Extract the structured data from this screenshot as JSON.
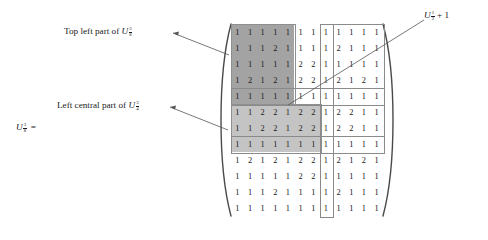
{
  "figure": {
    "lhs": {
      "variable": "U",
      "subscript_num": "3",
      "subscript_den": "8",
      "equals": "="
    },
    "annotations": [
      {
        "id": "top-left",
        "text_before": "Top left part of ",
        "variable": "U",
        "subscript_num": "3",
        "subscript_den": "8"
      },
      {
        "id": "left-central",
        "text_before": "Left central part of ",
        "variable": "U",
        "subscript_num": "3",
        "subscript_den": "4"
      },
      {
        "id": "u-half-plus-one",
        "text_before": "",
        "variable": "U",
        "subscript_num": "1",
        "subscript_den": "2",
        "text_after": " + 1"
      }
    ],
    "matrix": {
      "rows": 12,
      "cols": 12,
      "values": [
        [
          1,
          1,
          1,
          1,
          1,
          1,
          1,
          1,
          1,
          1,
          1,
          1
        ],
        [
          1,
          1,
          1,
          2,
          1,
          1,
          1,
          1,
          2,
          1,
          1,
          1
        ],
        [
          1,
          1,
          1,
          1,
          1,
          2,
          2,
          1,
          1,
          1,
          1,
          1
        ],
        [
          1,
          2,
          1,
          2,
          1,
          2,
          2,
          1,
          2,
          1,
          2,
          1
        ],
        [
          1,
          1,
          1,
          1,
          1,
          1,
          1,
          1,
          1,
          1,
          1,
          1
        ],
        [
          1,
          1,
          2,
          2,
          1,
          2,
          2,
          1,
          2,
          2,
          1,
          1
        ],
        [
          1,
          1,
          2,
          2,
          1,
          2,
          2,
          1,
          2,
          2,
          1,
          1
        ],
        [
          1,
          1,
          1,
          1,
          1,
          1,
          1,
          1,
          1,
          1,
          1,
          1
        ],
        [
          1,
          2,
          1,
          2,
          1,
          2,
          2,
          1,
          2,
          1,
          2,
          1
        ],
        [
          1,
          1,
          1,
          1,
          1,
          2,
          2,
          1,
          1,
          1,
          1,
          1
        ],
        [
          1,
          1,
          1,
          2,
          1,
          1,
          1,
          1,
          2,
          1,
          1,
          1
        ],
        [
          1,
          1,
          1,
          1,
          1,
          1,
          1,
          1,
          1,
          1,
          1,
          1
        ]
      ],
      "shading": {
        "dark_block": {
          "row_start": 1,
          "row_end": 5,
          "col_start": 1,
          "col_end": 5,
          "color": "#a3a3a3"
        },
        "mid_block": {
          "row_start": 6,
          "row_end": 8,
          "col_start": 1,
          "col_end": 7,
          "color": "#c4c4c4"
        }
      },
      "highlight_boxes": [
        {
          "id": "col-8-strip",
          "row_start": 1,
          "row_end": 12,
          "col_start": 8,
          "col_end": 8
        },
        {
          "id": "rows1-8-right",
          "row_start": 1,
          "row_end": 8,
          "col_start": 8,
          "col_end": 12
        },
        {
          "id": "row-5-strip",
          "row_start": 5,
          "row_end": 5,
          "col_start": 1,
          "col_end": 12
        },
        {
          "id": "row-8-strip",
          "row_start": 8,
          "row_end": 8,
          "col_start": 1,
          "col_end": 12
        }
      ]
    }
  }
}
